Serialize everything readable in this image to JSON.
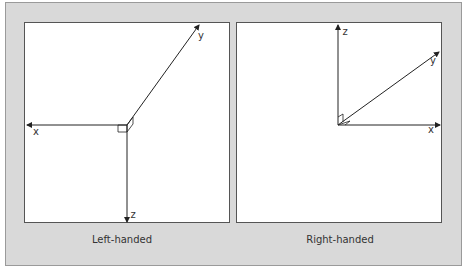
{
  "figure": {
    "background_color": "#d9d9d9",
    "panel_color": "#ffffff",
    "line_color": "#222222",
    "panels": [
      {
        "name": "left-handed",
        "caption": "Left-handed",
        "axes": {
          "x": "x",
          "y": "y",
          "z": "z"
        }
      },
      {
        "name": "right-handed",
        "caption": "Right-handed",
        "axes": {
          "x": "x",
          "y": "y",
          "z": "z"
        }
      }
    ]
  }
}
